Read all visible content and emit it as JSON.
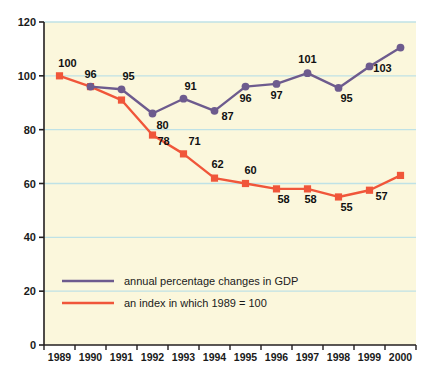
{
  "chart_data": {
    "type": "line",
    "title": "",
    "subtitle": "",
    "xlabel": "",
    "ylabel": "",
    "categories": [
      "1989",
      "1990",
      "1991",
      "1992",
      "1993",
      "1994",
      "1995",
      "1996",
      "1997",
      "1998",
      "1999",
      "2000"
    ],
    "xlim": [
      0,
      11
    ],
    "ylim": [
      0,
      120
    ],
    "yticks": [
      0,
      20,
      40,
      60,
      80,
      100,
      120
    ],
    "ytick_labels": [
      "0",
      "20",
      "40",
      "60",
      "80",
      "100",
      "120"
    ],
    "grid": true,
    "grid_axis": "y",
    "legend_position": "inside-bottom-left",
    "series": [
      {
        "name": "annual percentage changes in GDP",
        "color": "#6d5b8e",
        "marker": "circle",
        "x": [
          "1990",
          "1991",
          "1992",
          "1993",
          "1994",
          "1995",
          "1996",
          "1997",
          "1998",
          "1999",
          "2000"
        ],
        "values": [
          96,
          95,
          86,
          91.5,
          87,
          96,
          97,
          101,
          95.5,
          103.5,
          110.5
        ],
        "point_labels": [
          "96",
          "95",
          "80",
          "91",
          "87",
          "96",
          "97",
          "101",
          "95",
          "103",
          ""
        ],
        "label_offsets": [
          {
            "dx": 0,
            "dy": -9
          },
          {
            "dx": 7,
            "dy": -9
          },
          {
            "dx": 10,
            "dy": 15
          },
          {
            "dx": 7,
            "dy": -9
          },
          {
            "dx": 13,
            "dy": 9
          },
          {
            "dx": 0,
            "dy": 15
          },
          {
            "dx": 0,
            "dy": 15
          },
          {
            "dx": 0,
            "dy": -10
          },
          {
            "dx": 8,
            "dy": 14
          },
          {
            "dx": 13,
            "dy": 6
          },
          {
            "dx": 0,
            "dy": 0
          }
        ]
      },
      {
        "name": "an index in which 1989 = 100",
        "color": "#f0563a",
        "marker": "square",
        "x": [
          "1989",
          "1990",
          "1991",
          "1992",
          "1993",
          "1994",
          "1995",
          "1996",
          "1997",
          "1998",
          "1999",
          "2000"
        ],
        "values": [
          100,
          96,
          91,
          78,
          71,
          62,
          60,
          58,
          58,
          55,
          57.5,
          63
        ],
        "point_labels": [
          "100",
          "",
          "",
          "78",
          "71",
          "62",
          "60",
          "58",
          "58",
          "55",
          "57",
          ""
        ],
        "label_offsets": [
          {
            "dx": 8,
            "dy": -9
          },
          {
            "dx": 0,
            "dy": 0
          },
          {
            "dx": 0,
            "dy": 0
          },
          {
            "dx": 11,
            "dy": 10
          },
          {
            "dx": 11,
            "dy": -9
          },
          {
            "dx": 3,
            "dy": -10
          },
          {
            "dx": 5,
            "dy": -10
          },
          {
            "dx": 7,
            "dy": 14
          },
          {
            "dx": 3,
            "dy": 14
          },
          {
            "dx": 8,
            "dy": 14
          },
          {
            "dx": 12,
            "dy": 10
          },
          {
            "dx": 0,
            "dy": 0
          }
        ]
      }
    ]
  },
  "legend": {
    "items": [
      {
        "label": "annual percentage changes in GDP",
        "color": "#6d5b8e"
      },
      {
        "label": "an index in which 1989 = 100",
        "color": "#f0563a"
      }
    ]
  },
  "colors": {
    "plot_background": "#fbf7dc",
    "gridline": "#bfe2e6",
    "axis": "#231f20",
    "purple_series": "#6d5b8e",
    "red_series": "#f0563a",
    "page_background": "#ffffff",
    "text": "#1a1a1a"
  }
}
